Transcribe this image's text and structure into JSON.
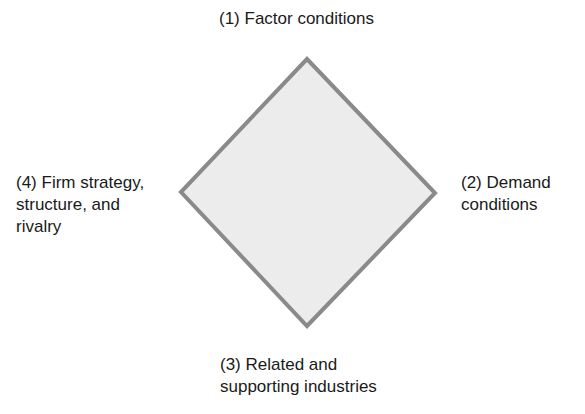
{
  "diagram": {
    "shape": "diamond",
    "colors": {
      "fill": "#ececec",
      "stroke": "#8a8a8a",
      "text": "#1a1a1a"
    },
    "nodes": [
      {
        "position": "top",
        "line1": "(1) Factor conditions",
        "line2": "",
        "line3": ""
      },
      {
        "position": "right",
        "line1": "(2) Demand",
        "line2": "conditions",
        "line3": ""
      },
      {
        "position": "bottom",
        "line1": "(3) Related and",
        "line2": "supporting industries",
        "line3": ""
      },
      {
        "position": "left",
        "line1": "(4) Firm strategy,",
        "line2": "structure, and",
        "line3": "rivalry"
      }
    ]
  }
}
